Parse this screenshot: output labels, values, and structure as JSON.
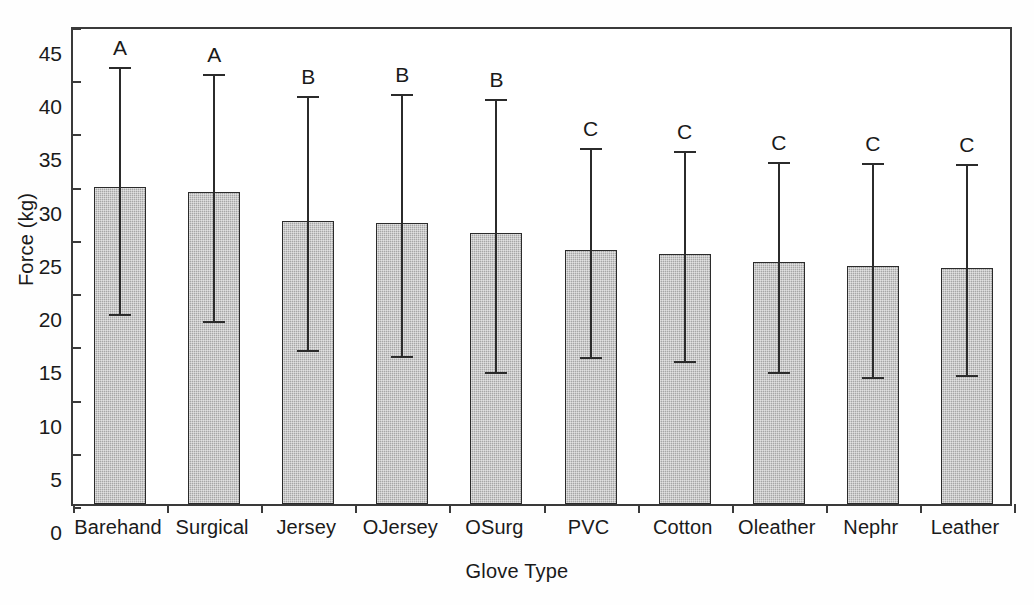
{
  "chart_data": {
    "type": "bar",
    "title": "",
    "xlabel": "Glove Type",
    "ylabel": "Force (kg)",
    "ylim": [
      0,
      45
    ],
    "ytick_step": 5,
    "yticks": [
      0,
      5,
      10,
      15,
      20,
      25,
      30,
      35,
      40,
      45
    ],
    "ytick_labels": [
      "0",
      "5",
      "10",
      "15",
      "20",
      "25",
      "30",
      "35",
      "40",
      "45"
    ],
    "grid": false,
    "legend": null,
    "categories": [
      "Barehand",
      "Surgical",
      "Jersey",
      "OJersey",
      "OSurg",
      "PVC",
      "Cotton",
      "Oleather",
      "Nephr",
      "Leather"
    ],
    "values": [
      29.8,
      29.3,
      26.6,
      26.4,
      25.5,
      23.9,
      23.5,
      22.7,
      22.4,
      22.2
    ],
    "error_upper": [
      41.4,
      40.8,
      38.7,
      38.9,
      38.4,
      33.8,
      33.5,
      32.5,
      32.4,
      32.3
    ],
    "error_lower": [
      18.2,
      17.6,
      14.8,
      14.3,
      12.8,
      14.2,
      13.8,
      12.8,
      12.3,
      12.5
    ],
    "annotations": [
      "A",
      "A",
      "B",
      "B",
      "B",
      "C",
      "C",
      "C",
      "C",
      "C"
    ],
    "bar_fill_color": "#a6a6a6",
    "bar_edge_color": "#2b2b2b",
    "axis_color": "#3a3a3a"
  }
}
